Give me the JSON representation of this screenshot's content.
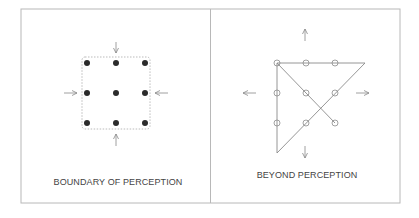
{
  "panels": [
    {
      "id": "left",
      "title": "BOUNDARY OF PERCEPTION",
      "dot_style": "filled",
      "boundary": "dashed-square",
      "arrows": [
        "down (from top)",
        "right (from left)",
        "left (from right)",
        "up (from bottom)"
      ]
    },
    {
      "id": "right",
      "title": "BEYOND PERCEPTION",
      "dot_style": "hollow",
      "solution_lines": 4,
      "arrows": [
        "up",
        "left",
        "right",
        "down"
      ]
    }
  ],
  "colors": {
    "frame": "#b8b8b8",
    "dot_fill": "#2b2b2b",
    "line": "#8a8a8a",
    "text": "#444444",
    "boundary": "#aaaaaa"
  }
}
